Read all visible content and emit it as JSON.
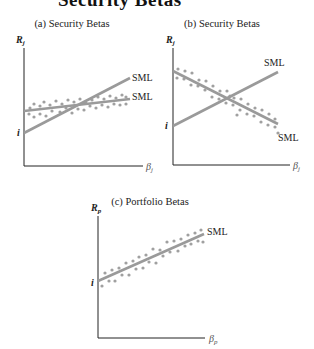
{
  "title": "Security Betas",
  "colors": {
    "axis": "#222222",
    "line": "#9a9a9a",
    "dots": "#a0a0a0",
    "text": "#222222"
  },
  "panels": [
    {
      "id": "a",
      "title": "(a) Security Betas",
      "y_label": "R",
      "y_sub": "j",
      "x_label": "β",
      "x_sub": "j",
      "intercept_label": "i",
      "lines": [
        {
          "label": "SML",
          "kind": "steep"
        },
        {
          "label": "SML",
          "kind": "flat"
        }
      ]
    },
    {
      "id": "b",
      "title": "(b) Security Betas",
      "y_label": "R",
      "y_sub": "j",
      "x_label": "β",
      "x_sub": "j",
      "intercept_label": "i",
      "lines": [
        {
          "label": "SML",
          "kind": "rising"
        },
        {
          "label": "SML",
          "kind": "falling"
        }
      ]
    },
    {
      "id": "c",
      "title": "(c) Portfolio Betas",
      "y_label": "R",
      "y_sub": "p",
      "x_label": "β",
      "x_sub": "p",
      "intercept_label": "i",
      "lines": [
        {
          "label": "SML",
          "kind": "rising"
        }
      ]
    }
  ]
}
